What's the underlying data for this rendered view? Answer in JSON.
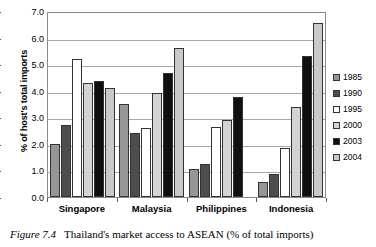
{
  "caption": {
    "figure_number": "Figure 7.4",
    "text": "Thailand's market access to ASEAN (% of total imports)"
  },
  "axes": {
    "ylabel": "% of host's total imports",
    "yticks": [
      "7.0",
      "6.0",
      "5.0",
      "4.0",
      "3.0",
      "2.0",
      "1.0",
      "0.0"
    ]
  },
  "legend": {
    "items": [
      {
        "label": "1985",
        "color": "#969696"
      },
      {
        "label": "1990",
        "color": "#4d4d4d"
      },
      {
        "label": "1995",
        "color": "#ffffff"
      },
      {
        "label": "2000",
        "color": "#d4d4d4"
      },
      {
        "label": "2003",
        "color": "#101010"
      },
      {
        "label": "2004",
        "color": "#c9c9c9"
      }
    ]
  },
  "chart_data": {
    "type": "bar",
    "title": "Thailand's market access to ASEAN (% of total imports)",
    "xlabel": "",
    "ylabel": "% of host's total imports",
    "ylim": [
      0,
      7
    ],
    "ytick_step": 1.0,
    "grid": true,
    "legend_position": "right",
    "categories": [
      "Singapore",
      "Malaysia",
      "Philippines",
      "Indonesia"
    ],
    "series": [
      {
        "name": "1985",
        "color": "#969696",
        "values": [
          2.0,
          3.5,
          1.05,
          0.55
        ]
      },
      {
        "name": "1990",
        "color": "#4d4d4d",
        "values": [
          2.7,
          2.4,
          1.25,
          0.85
        ]
      },
      {
        "name": "1995",
        "color": "#ffffff",
        "values": [
          5.2,
          2.6,
          2.65,
          1.85
        ]
      },
      {
        "name": "2000",
        "color": "#d4d4d4",
        "values": [
          4.3,
          3.9,
          2.9,
          3.4
        ]
      },
      {
        "name": "2003",
        "color": "#101010",
        "values": [
          4.35,
          4.65,
          3.75,
          5.3
        ]
      },
      {
        "name": "2004",
        "color": "#c9c9c9",
        "values": [
          4.1,
          5.6,
          0.0,
          6.55
        ]
      }
    ]
  }
}
